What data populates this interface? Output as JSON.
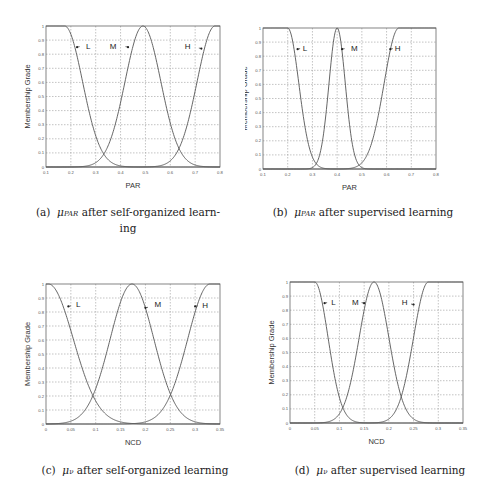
{
  "chart_data": [
    {
      "id": "a",
      "type": "line",
      "title": "",
      "xlabel": "PAR",
      "ylabel": "Membership Grade",
      "xlim": [
        0.1,
        0.8
      ],
      "ylim": [
        0,
        1
      ],
      "xticks": [
        "0.1",
        "0.2",
        "0.3",
        "0.4",
        "0.5",
        "0.6",
        "0.7",
        "0.8"
      ],
      "yticks": [
        "0",
        "0.1",
        "0.2",
        "0.3",
        "0.4",
        "0.5",
        "0.6",
        "0.7",
        "0.8",
        "0.9",
        "1"
      ],
      "grid": true,
      "series": [
        {
          "name": "L",
          "shape": "left-shoulder",
          "flat_until": 0.175,
          "sigma": 0.072
        },
        {
          "name": "M",
          "shape": "gaussian",
          "center": 0.49,
          "sigma": 0.072
        },
        {
          "name": "H",
          "shape": "right-shoulder",
          "flat_from": 0.78,
          "sigma": 0.072
        }
      ],
      "annotations": [
        {
          "text": "L",
          "x": 0.27,
          "y": 0.86,
          "arrow_to": [
            0.225,
            0.85
          ]
        },
        {
          "text": "M",
          "x": 0.37,
          "y": 0.86,
          "arrow_to": [
            0.43,
            0.85
          ]
        },
        {
          "text": "H",
          "x": 0.67,
          "y": 0.86,
          "arrow_to": [
            0.725,
            0.84
          ]
        }
      ],
      "box": {
        "left": 46,
        "top": 26,
        "width": 174,
        "height": 141
      }
    },
    {
      "id": "b",
      "type": "line",
      "title": "",
      "xlabel": "PAR",
      "ylabel": "Membership Grade",
      "xlim": [
        0.1,
        0.8
      ],
      "ylim": [
        0,
        1
      ],
      "xticks": [
        "0.1",
        "0.2",
        "0.3",
        "0.4",
        "0.5",
        "0.6",
        "0.7",
        "0.8"
      ],
      "yticks": [
        "0",
        "0.1",
        "0.2",
        "0.3",
        "0.4",
        "0.5",
        "0.6",
        "0.7",
        "0.8",
        "0.9",
        "1"
      ],
      "grid": true,
      "series": [
        {
          "name": "L",
          "shape": "left-shoulder",
          "flat_until": 0.2,
          "sigma": 0.045
        },
        {
          "name": "M",
          "shape": "gaussian",
          "center": 0.4,
          "sigma": 0.033
        },
        {
          "name": "H",
          "shape": "right-shoulder",
          "flat_from": 0.65,
          "sigma": 0.06
        }
      ],
      "annotations": [
        {
          "text": "L",
          "x": 0.27,
          "y": 0.86,
          "arrow_to": [
            0.24,
            0.85
          ]
        },
        {
          "text": "M",
          "x": 0.47,
          "y": 0.86,
          "arrow_to": [
            0.42,
            0.85
          ]
        },
        {
          "text": "H",
          "x": 0.645,
          "y": 0.86,
          "arrow_to": [
            0.615,
            0.85
          ]
        }
      ],
      "box": {
        "left": 263,
        "top": 28,
        "width": 173,
        "height": 141
      }
    },
    {
      "id": "c",
      "type": "line",
      "title": "",
      "xlabel": "NCD",
      "ylabel": "Membership Grade",
      "xlim": [
        0,
        0.35
      ],
      "ylim": [
        0,
        1
      ],
      "xticks": [
        "0",
        "0.05",
        "0.1",
        "0.15",
        "0.2",
        "0.25",
        "0.3",
        "0.35"
      ],
      "yticks": [
        "0",
        "0.1",
        "0.2",
        "0.3",
        "0.4",
        "0.5",
        "0.6",
        "0.7",
        "0.8",
        "0.9",
        "1"
      ],
      "grid": true,
      "series": [
        {
          "name": "L",
          "shape": "left-shoulder",
          "flat_until": 0.005,
          "sigma": 0.05
        },
        {
          "name": "M",
          "shape": "gaussian",
          "center": 0.173,
          "sigma": 0.044
        },
        {
          "name": "H",
          "shape": "right-shoulder",
          "flat_from": 0.33,
          "sigma": 0.045
        }
      ],
      "annotations": [
        {
          "text": "L",
          "x": 0.065,
          "y": 0.86,
          "arrow_to": [
            0.045,
            0.84
          ]
        },
        {
          "text": "M",
          "x": 0.225,
          "y": 0.86,
          "arrow_to": [
            0.2,
            0.83
          ]
        },
        {
          "text": "H",
          "x": 0.32,
          "y": 0.85,
          "arrow_to": [
            0.3,
            0.84
          ]
        }
      ],
      "box": {
        "left": 46,
        "top": 284,
        "width": 174,
        "height": 140
      }
    },
    {
      "id": "d",
      "type": "line",
      "title": "",
      "xlabel": "NCD",
      "ylabel": "Membership Grade",
      "xlim": [
        0,
        0.35
      ],
      "ylim": [
        0,
        1
      ],
      "xticks": [
        "0",
        "0.05",
        "0.1",
        "0.15",
        "0.2",
        "0.25",
        "0.3",
        "0.35"
      ],
      "yticks": [
        "0",
        "0.1",
        "0.2",
        "0.3",
        "0.4",
        "0.5",
        "0.6",
        "0.7",
        "0.8",
        "0.9",
        "1"
      ],
      "grid": true,
      "series": [
        {
          "name": "L",
          "shape": "left-shoulder",
          "flat_until": 0.05,
          "sigma": 0.027
        },
        {
          "name": "M",
          "shape": "gaussian",
          "center": 0.17,
          "sigma": 0.03
        },
        {
          "name": "H",
          "shape": "right-shoulder",
          "flat_from": 0.28,
          "sigma": 0.03
        }
      ],
      "annotations": [
        {
          "text": "L",
          "x": 0.088,
          "y": 0.86,
          "arrow_to": [
            0.07,
            0.85
          ]
        },
        {
          "text": "M",
          "x": 0.132,
          "y": 0.86,
          "arrow_to": [
            0.15,
            0.85
          ]
        },
        {
          "text": "H",
          "x": 0.232,
          "y": 0.86,
          "arrow_to": [
            0.25,
            0.84
          ]
        }
      ],
      "box": {
        "left": 290,
        "top": 282,
        "width": 173,
        "height": 141
      }
    }
  ],
  "captions": {
    "a": {
      "label": "(a)",
      "mu": "μ",
      "sub": "PAR",
      "text": "after self-organized learn-",
      "text2": "ing"
    },
    "b": {
      "label": "(b)",
      "mu": "μ",
      "sub": "PAR",
      "text": "after supervised learning"
    },
    "c": {
      "label": "(c)",
      "mu": "μ",
      "sub": "ν",
      "text": "after self-organized learning"
    },
    "d": {
      "label": "(d)",
      "mu": "μ",
      "sub": "ν",
      "text": "after supervised learning"
    }
  },
  "colors": {
    "curve": "#555555",
    "grid": "#9a9a9a",
    "axis": "#666666",
    "text": "#222222"
  }
}
